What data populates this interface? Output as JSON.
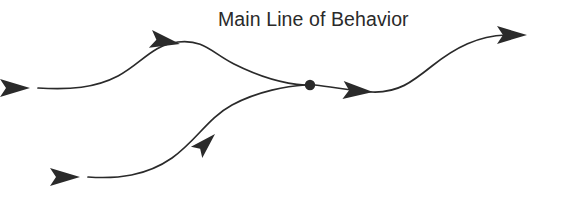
{
  "diagram": {
    "title": "Main Line of Behavior",
    "background_color": "#ffffff",
    "ink_color": "#2a2a2a",
    "label": {
      "text": "Main Line of Behavior",
      "x": 218,
      "y": 26,
      "font_size": 19.5
    },
    "junction": {
      "name": "convergence-point",
      "x": 310,
      "y": 85,
      "radius": 5.2
    },
    "paths": [
      {
        "name": "upper-branch",
        "description": "Upper wavy line entering from left, cresting, descending to the junction point",
        "d": "M 38 88 C 70 90 95 88 118 76 C 142 63 152 45 178 42 C 204 39 212 53 234 64 C 262 78 286 84 305 85"
      },
      {
        "name": "lower-branch",
        "description": "Lower S-curve rising from bottom-left to the junction point",
        "d": "M 88 177 C 118 179 146 176 172 158 C 196 141 208 118 232 105 C 258 91 288 86 305 85"
      },
      {
        "name": "main-line-continuation",
        "description": "Single merged line continuing right, dipping then rising to the final arrow",
        "d": "M 315 85 C 334 87 352 91 372 92 C 398 93 412 82 432 66 C 456 47 478 36 506 35 L 522 35"
      }
    ],
    "arrow_heads": [
      {
        "name": "upper-branch-start-arrow",
        "x": 30,
        "y": 88,
        "angle": 0
      },
      {
        "name": "upper-branch-crest-arrow",
        "x": 180,
        "y": 44,
        "angle": 10
      },
      {
        "name": "lower-branch-start-arrow",
        "x": 80,
        "y": 177,
        "angle": 0
      },
      {
        "name": "lower-branch-rising-arrow",
        "x": 215,
        "y": 134,
        "angle": -45
      },
      {
        "name": "main-line-trough-arrow",
        "x": 373,
        "y": 92,
        "angle": 4
      },
      {
        "name": "main-line-end-arrow",
        "x": 527,
        "y": 35,
        "angle": 0
      }
    ]
  }
}
